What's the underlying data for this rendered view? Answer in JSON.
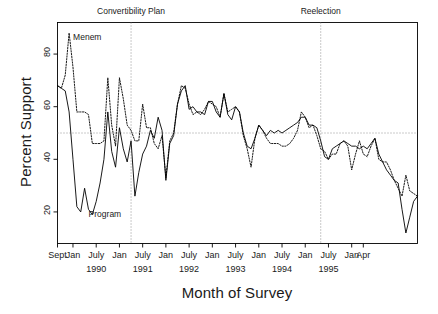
{
  "chart_data": {
    "type": "line",
    "title": "",
    "xlabel": "Month of Survey",
    "ylabel": "Percent Support",
    "ylim": [
      8,
      92
    ],
    "yticks": [
      20,
      40,
      60,
      80
    ],
    "ytick_labels": [
      "20",
      "40",
      "60",
      "80"
    ],
    "grid": false,
    "legend_position": "inline-annotations",
    "x_start_label": "Sept 1989",
    "x_end_label": "Apr 1996",
    "xtick_labels": [
      "Sept",
      "Jan",
      "July",
      "Jan",
      "July",
      "Jan",
      "July",
      "Jan",
      "July",
      "Jan",
      "July",
      "Jan",
      "July",
      "Jan",
      "Apr"
    ],
    "xtick_months": [
      "1989-09",
      "1990-01",
      "1990-07",
      "1991-01",
      "1991-07",
      "1992-01",
      "1992-07",
      "1993-01",
      "1993-07",
      "1994-01",
      "1994-07",
      "1995-01",
      "1995-07",
      "1996-01",
      "1996-04"
    ],
    "xyear_labels": [
      "1990",
      "1991",
      "1992",
      "1993",
      "1994",
      "1995"
    ],
    "xyear_months": [
      "1990-07",
      "1991-07",
      "1992-07",
      "1993-07",
      "1994-07",
      "1995-07"
    ],
    "reference_line_y": 50,
    "annotations": [
      {
        "name": "convertibility-plan",
        "label": "Convertibility Plan",
        "month": "1991-04"
      },
      {
        "name": "reelection",
        "label": "Reelection",
        "month": "1995-05"
      }
    ],
    "series": [
      {
        "name": "Menem",
        "style": "dotted",
        "color": "#000000",
        "label_month": "1989-12",
        "label_value": 86,
        "values": [
          68,
          67,
          72,
          88,
          75,
          58,
          58,
          58,
          57,
          46,
          46,
          46,
          47,
          71,
          53,
          45,
          71,
          63,
          53,
          51,
          47,
          47,
          61,
          52,
          52,
          46,
          44,
          49,
          33,
          47,
          50,
          61,
          68,
          67,
          61,
          57,
          58,
          57,
          59,
          62,
          61,
          60,
          56,
          65,
          58,
          59,
          60,
          58,
          49,
          44,
          37,
          48,
          53,
          51,
          48,
          46,
          46,
          46,
          45,
          45,
          46,
          48,
          51,
          58,
          56,
          52,
          53,
          49,
          44,
          43,
          40,
          42,
          42,
          46,
          47,
          45,
          36,
          42,
          47,
          42,
          41,
          45,
          48,
          40,
          39,
          39,
          36,
          32,
          29,
          26,
          34,
          28,
          27,
          26
        ]
      },
      {
        "name": "Program",
        "style": "solid",
        "color": "#000000",
        "label_month": "1990-04",
        "label_value": 19,
        "values": [
          68,
          67,
          66,
          58,
          40,
          22,
          20,
          29,
          21,
          19,
          24,
          31,
          40,
          58,
          43,
          37,
          52,
          44,
          39,
          47,
          26,
          35,
          42,
          45,
          51,
          48,
          56,
          51,
          32,
          46,
          49,
          61,
          66,
          68,
          59,
          60,
          58,
          58,
          57,
          62,
          62,
          58,
          56,
          65,
          57,
          55,
          60,
          58,
          50,
          45,
          44,
          48,
          53,
          51,
          49,
          51,
          50,
          51,
          50,
          51,
          52,
          53,
          54,
          56,
          56,
          53,
          53,
          52,
          47,
          41,
          40,
          44,
          45,
          46,
          47,
          46,
          45,
          45,
          44,
          45,
          44,
          46,
          48,
          42,
          39,
          36,
          34,
          32,
          31,
          21,
          12,
          18,
          24,
          26
        ]
      }
    ]
  },
  "figure": {
    "y_axis_title": "Percent Support",
    "x_axis_title": "Month of Survey"
  }
}
